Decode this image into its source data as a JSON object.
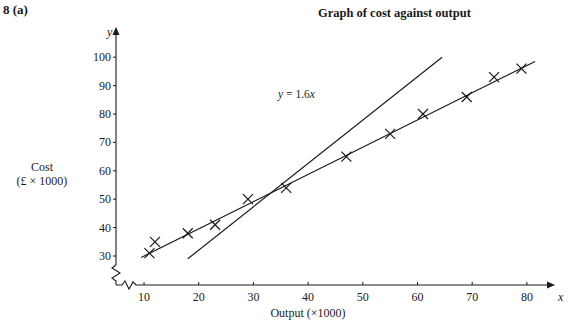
{
  "question": {
    "number": "8",
    "part": "(a)",
    "label": "8   (a)"
  },
  "chart_data": {
    "type": "scatter",
    "title": "Graph of cost against output",
    "xlabel": "Output (×1000)",
    "ylabel_line1": "Cost",
    "ylabel_line2": "(£ × 1000)",
    "x_axis_var": "x",
    "y_axis_var": "y",
    "xlim": [
      5,
      85
    ],
    "ylim": [
      20,
      105
    ],
    "axis_break": true,
    "grid": false,
    "x_ticks": [
      10,
      20,
      30,
      40,
      50,
      60,
      70,
      80
    ],
    "y_ticks": [
      30,
      40,
      50,
      60,
      70,
      80,
      90,
      100
    ],
    "series": [
      {
        "name": "Observed cost",
        "marker": "x",
        "x": [
          11,
          12,
          18,
          23,
          29,
          36,
          47,
          55,
          61,
          69,
          74,
          79
        ],
        "y": [
          31,
          35,
          38,
          41,
          50,
          54,
          65,
          73,
          80,
          86,
          93,
          96
        ]
      }
    ],
    "lines": [
      {
        "name": "Line of best fit",
        "x": [
          9.5,
          81.5
        ],
        "y": [
          29.5,
          98.5
        ]
      },
      {
        "name": "y = 1.6x",
        "label": "y = 1.6x",
        "x": [
          18,
          64.5
        ],
        "y": [
          29,
          100
        ]
      }
    ],
    "annotations": [
      {
        "text": "y = 1.6x",
        "x": 40,
        "y": 87
      }
    ]
  }
}
